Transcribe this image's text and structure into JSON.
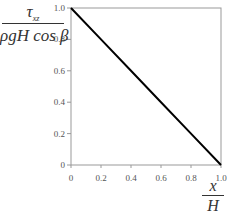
{
  "chart_data": {
    "type": "line",
    "title": "",
    "xlabel": "x / H",
    "ylabel": "τ_xz / (ρgH cos β)",
    "xlim": [
      0,
      1.0
    ],
    "ylim": [
      0,
      1.0
    ],
    "x_ticks": [
      "0",
      "0.2",
      "0.4",
      "0.6",
      "0.8",
      "1.0"
    ],
    "y_ticks": [
      "0",
      "0.2",
      "0.4",
      "0.6",
      "0.8",
      "1.0"
    ],
    "grid": false,
    "legend": null,
    "series": [
      {
        "name": "shear stress",
        "x": [
          0,
          0.2,
          0.4,
          0.6,
          0.8,
          1.0
        ],
        "y": [
          1.0,
          0.8,
          0.6,
          0.4,
          0.2,
          0
        ],
        "color": "#000000"
      }
    ]
  },
  "labels": {
    "y_numerator": "τ",
    "y_numerator_sub": "xz",
    "y_denominator": "ρgH cos β",
    "x_numerator": "x",
    "x_denominator": "H"
  },
  "colors": {
    "line": "#000000",
    "axes": "#888888"
  }
}
